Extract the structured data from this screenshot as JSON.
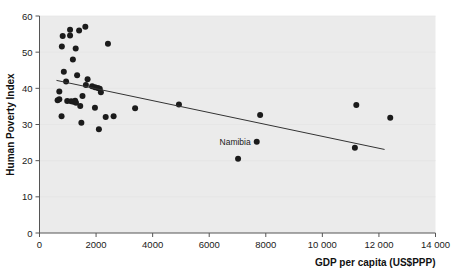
{
  "chart_data": {
    "type": "scatter",
    "title": "",
    "xlabel": "GDP per capita (US$PPP)",
    "ylabel": "Human Poverty Index",
    "xlim": [
      0,
      14000
    ],
    "ylim": [
      0,
      60
    ],
    "grid": false,
    "legend": null,
    "xticks": [
      0,
      2000,
      4000,
      6000,
      8000,
      10000,
      12000,
      14000
    ],
    "xtick_labels": [
      "0",
      "2000",
      "4000",
      "6000",
      "8000",
      "10 000",
      "12 000",
      "14 000"
    ],
    "yticks": [
      0,
      10,
      20,
      30,
      40,
      50,
      60
    ],
    "ytick_labels": [
      "0",
      "10",
      "20",
      "30",
      "40",
      "50",
      "60"
    ],
    "marker_color": "#1b1b1b",
    "marker_size": 3.0,
    "plot_background": "#ebebeb",
    "axis_color": "#555555",
    "points": [
      {
        "x": 820,
        "y": 54.5
      },
      {
        "x": 1080,
        "y": 56.2
      },
      {
        "x": 1400,
        "y": 56.0
      },
      {
        "x": 1080,
        "y": 54.6
      },
      {
        "x": 1620,
        "y": 57.0
      },
      {
        "x": 790,
        "y": 51.6
      },
      {
        "x": 1280,
        "y": 51.0
      },
      {
        "x": 2420,
        "y": 52.3
      },
      {
        "x": 1180,
        "y": 48.0
      },
      {
        "x": 1330,
        "y": 43.6
      },
      {
        "x": 860,
        "y": 44.6
      },
      {
        "x": 940,
        "y": 41.9
      },
      {
        "x": 1700,
        "y": 42.5
      },
      {
        "x": 1640,
        "y": 40.9
      },
      {
        "x": 1860,
        "y": 40.6
      },
      {
        "x": 1960,
        "y": 40.3
      },
      {
        "x": 2060,
        "y": 40.1
      },
      {
        "x": 2130,
        "y": 39.9
      },
      {
        "x": 2170,
        "y": 38.9
      },
      {
        "x": 1520,
        "y": 37.9
      },
      {
        "x": 700,
        "y": 39.1
      },
      {
        "x": 700,
        "y": 37.0
      },
      {
        "x": 640,
        "y": 36.7
      },
      {
        "x": 980,
        "y": 36.5
      },
      {
        "x": 1120,
        "y": 36.4
      },
      {
        "x": 1200,
        "y": 36.3
      },
      {
        "x": 1260,
        "y": 36.6
      },
      {
        "x": 1290,
        "y": 36.0
      },
      {
        "x": 1440,
        "y": 35.1
      },
      {
        "x": 1960,
        "y": 34.6
      },
      {
        "x": 3380,
        "y": 34.5
      },
      {
        "x": 4930,
        "y": 35.5
      },
      {
        "x": 11200,
        "y": 35.4
      },
      {
        "x": 780,
        "y": 32.3
      },
      {
        "x": 1480,
        "y": 30.5
      },
      {
        "x": 2340,
        "y": 32.1
      },
      {
        "x": 2620,
        "y": 32.3
      },
      {
        "x": 7800,
        "y": 32.6
      },
      {
        "x": 12400,
        "y": 31.9
      },
      {
        "x": 2100,
        "y": 28.7
      },
      {
        "x": 7680,
        "y": 25.2
      },
      {
        "x": 11150,
        "y": 23.6
      },
      {
        "x": 7020,
        "y": 20.5
      }
    ],
    "annotations": [
      {
        "text": "Namibia",
        "x": 7680,
        "y": 25.2,
        "position": "left"
      }
    ],
    "trendline": {
      "x0": 600,
      "y0": 42.2,
      "x1": 12200,
      "y1": 23.1,
      "color": "#333333",
      "width": 1
    }
  }
}
